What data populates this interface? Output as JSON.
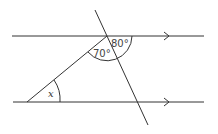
{
  "diagram": {
    "type": "parallel lines with transversals (geometry)",
    "angles": [
      {
        "label": "80°",
        "position": "between top line (right) and transversal at top intersection"
      },
      {
        "label": "70°",
        "position": "between transversal and slanted line at top intersection"
      },
      {
        "label": "x",
        "position": "between slanted line and bottom line at left vertex"
      }
    ],
    "parallel_markers": [
      "arrow",
      "arrow"
    ]
  },
  "labels": {
    "angle_80": "80°",
    "angle_70": "70°",
    "angle_x": "x"
  }
}
